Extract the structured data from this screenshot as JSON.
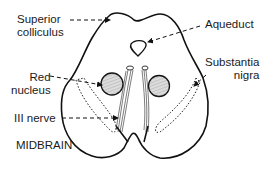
{
  "diagram": {
    "title": "MIDBRAIN",
    "labels": {
      "superior_colliculus_line1": "Superior",
      "superior_colliculus_line2": "colliculus",
      "aqueduct": "Aqueduct",
      "substantia_nigra_line1": "Substantia",
      "substantia_nigra_line2": "nigra",
      "red_nucleus_line1": "Red",
      "red_nucleus_line2": "nucleus",
      "iii_nerve": "III nerve"
    },
    "structures": [
      "outline-of-midbrain-cross-section",
      "superior-colliculus",
      "aqueduct",
      "red-nucleus-left",
      "red-nucleus-right",
      "substantia-nigra-left",
      "substantia-nigra-right",
      "oculomotor-nerve-left",
      "oculomotor-nerve-right"
    ],
    "colors": {
      "line": "#111111",
      "nucleus_fill": "#d8d8d8",
      "text": "#1a1a1a",
      "background": "#ffffff"
    }
  }
}
